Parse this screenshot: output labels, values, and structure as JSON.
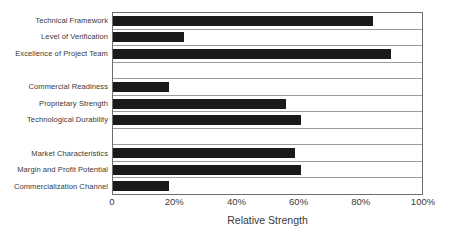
{
  "chart_data": {
    "type": "bar",
    "orientation": "horizontal",
    "title": "",
    "xlabel": "Relative Strength",
    "ylabel": "",
    "xlim": [
      0,
      100
    ],
    "xticks": [
      "0",
      "20%",
      "40%",
      "60%",
      "80%",
      "100%"
    ],
    "xtick_values": [
      0,
      20,
      40,
      60,
      80,
      100
    ],
    "grid": "horizontal-row-separators",
    "legend": "none",
    "bar_color": "#1a1a1a",
    "categories": [
      "Technical Framework",
      "Level of Verification",
      "Excellence of Project Team",
      "",
      "Commercial Readiness",
      "Proprietary Strength",
      "Technological Durability",
      "",
      "Market Characteristics",
      "Margin and Profit Potential",
      "Commercialization Channel"
    ],
    "values": [
      84,
      23,
      90,
      null,
      18,
      56,
      61,
      null,
      59,
      61,
      18
    ],
    "rows": [
      {
        "label": "Technical Framework",
        "value": 84,
        "spacer": false
      },
      {
        "label": "Level of Verification",
        "value": 23,
        "spacer": false
      },
      {
        "label": "Excellence of Project Team",
        "value": 90,
        "spacer": false
      },
      {
        "label": "",
        "value": null,
        "spacer": true
      },
      {
        "label": "Commercial Readiness",
        "value": 18,
        "spacer": false
      },
      {
        "label": "Proprietary Strength",
        "value": 56,
        "spacer": false
      },
      {
        "label": "Technological Durability",
        "value": 61,
        "spacer": false
      },
      {
        "label": "",
        "value": null,
        "spacer": true
      },
      {
        "label": "Market Characteristics",
        "value": 59,
        "spacer": false
      },
      {
        "label": "Margin and Profit Potential",
        "value": 61,
        "spacer": false
      },
      {
        "label": "Commercialization Channel",
        "value": 18,
        "spacer": false
      }
    ]
  },
  "colors": {
    "bar": "#1a1a1a",
    "plot_border": "#6e6e6e",
    "row_separator": "#9a9a9a",
    "text": "#3a3a3a",
    "background": "#ffffff"
  }
}
